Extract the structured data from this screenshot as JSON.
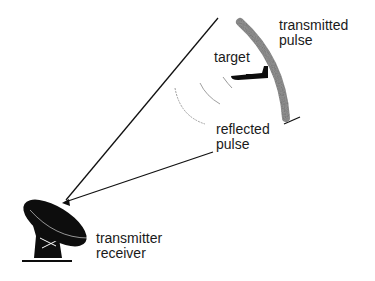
{
  "labels": {
    "transmitted_pulse": [
      "transmitted",
      "pulse"
    ],
    "target": "target",
    "reflected_pulse": [
      "reflected",
      "pulse"
    ],
    "transmitter_receiver": [
      "transmitter",
      "receiver"
    ]
  },
  "colors": {
    "line": "#111111",
    "pulse": "#8a8a8a",
    "reflected_arcs": "#9a9a9a",
    "dish": "#0d0d0d"
  }
}
